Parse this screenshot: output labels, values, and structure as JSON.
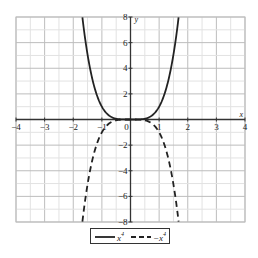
{
  "chart_data": {
    "type": "line",
    "title": "",
    "xlabel": "x",
    "ylabel": "y",
    "xlim": [
      -4,
      4
    ],
    "ylim": [
      -8,
      8
    ],
    "grid": true,
    "x_ticks": [
      -4,
      -3,
      -2,
      -1,
      0,
      1,
      2,
      3,
      4
    ],
    "x_tick_labels": [
      "-4",
      "-3",
      "-2",
      "-1",
      "0",
      "1",
      "2",
      "3",
      "4"
    ],
    "y_ticks": [
      -8,
      -6,
      -4,
      -2,
      2,
      4,
      6,
      8
    ],
    "y_tick_labels": [
      "-8",
      "-6",
      "-4",
      "-2",
      "2",
      "4",
      "6",
      "8"
    ],
    "legend_position": "bottom",
    "series": [
      {
        "name": "x^4",
        "style": "solid",
        "color": "#222222",
        "function": "x^4",
        "x": [
          -1.68,
          -1.5,
          -1.25,
          -1,
          -0.75,
          -0.5,
          0,
          0.5,
          0.75,
          1,
          1.25,
          1.5,
          1.68
        ],
        "values": [
          7.97,
          5.06,
          2.44,
          1,
          0.32,
          0.06,
          0,
          0.06,
          0.32,
          1,
          2.44,
          5.06,
          7.97
        ]
      },
      {
        "name": "-x^4",
        "style": "dashed",
        "color": "#222222",
        "function": "-x^4",
        "x": [
          -1.68,
          -1.5,
          -1.25,
          -1,
          -0.75,
          -0.5,
          0,
          0.5,
          0.75,
          1,
          1.25,
          1.5,
          1.68
        ],
        "values": [
          -7.97,
          -5.06,
          -2.44,
          -1,
          -0.32,
          -0.06,
          0,
          -0.06,
          -0.32,
          -1,
          -2.44,
          -5.06,
          -7.97
        ]
      }
    ]
  },
  "legend": {
    "items": [
      {
        "label": "x",
        "exp": "4",
        "prefix": ""
      },
      {
        "label": "x",
        "exp": "4",
        "prefix": "−"
      }
    ]
  }
}
